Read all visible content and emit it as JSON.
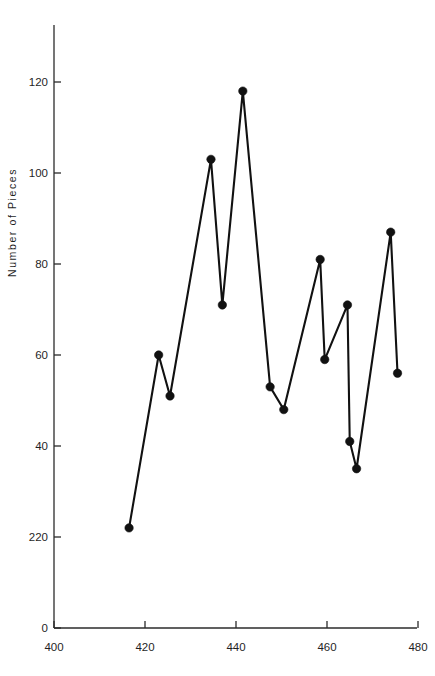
{
  "chart_data": {
    "type": "line",
    "title": "",
    "subtitle": "",
    "xlabel": "",
    "ylabel": "Number of Pieces",
    "xlim": [
      395,
      481
    ],
    "ylim": [
      0,
      130
    ],
    "grid": false,
    "legend": null,
    "markers": "filled-circle",
    "x": [
      416.5,
      423.0,
      425.5,
      434.5,
      437.0,
      441.5,
      447.5,
      450.5,
      458.5,
      459.5,
      464.5,
      465.0,
      466.5,
      474.0,
      475.5
    ],
    "values": [
      22,
      60,
      51,
      103,
      71,
      118,
      53,
      48,
      81,
      59,
      71,
      41,
      35,
      87,
      56
    ],
    "points": [
      {
        "x": 416.5,
        "y": 22
      },
      {
        "x": 423.0,
        "y": 60
      },
      {
        "x": 425.5,
        "y": 51
      },
      {
        "x": 434.5,
        "y": 103
      },
      {
        "x": 437.0,
        "y": 71
      },
      {
        "x": 441.5,
        "y": 118
      },
      {
        "x": 447.5,
        "y": 53
      },
      {
        "x": 450.5,
        "y": 48
      },
      {
        "x": 458.5,
        "y": 81
      },
      {
        "x": 459.5,
        "y": 59
      },
      {
        "x": 464.5,
        "y": 71
      },
      {
        "x": 465.0,
        "y": 41
      },
      {
        "x": 466.5,
        "y": 35
      },
      {
        "x": 474.0,
        "y": 87
      },
      {
        "x": 475.5,
        "y": 56
      }
    ],
    "y_ticks": [
      {
        "value": 120,
        "label": "120"
      },
      {
        "value": 100,
        "label": "100"
      },
      {
        "value": 80,
        "label": "80"
      },
      {
        "value": 60,
        "label": "60"
      },
      {
        "value": 40,
        "label": "40"
      },
      {
        "value": 20,
        "label": "220"
      },
      {
        "value": 0,
        "label": "0"
      }
    ],
    "x_ticks": [
      {
        "value": 400,
        "label": "400"
      },
      {
        "value": 420,
        "label": "420"
      },
      {
        "value": 440,
        "label": "440"
      },
      {
        "value": 460,
        "label": "460"
      },
      {
        "value": 480,
        "label": "480"
      }
    ],
    "colors": {
      "line": "#111111",
      "marker": "#111111",
      "axis": "#2b2b2b",
      "text": "#1f1f1f",
      "background": "#ffffff"
    }
  },
  "axis": {
    "y_title": "Number of Pieces"
  }
}
